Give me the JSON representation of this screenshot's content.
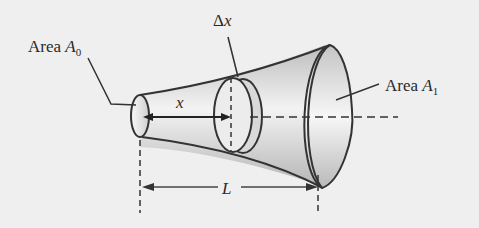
{
  "diagram": {
    "labels": {
      "area_small": {
        "prefix": "Area ",
        "var": "A",
        "sub": "0"
      },
      "area_large": {
        "prefix": "Area ",
        "var": "A",
        "sub": "1"
      },
      "delta_x": {
        "delta": "Δ",
        "var": "x"
      },
      "x": "x",
      "L": "L"
    },
    "colors": {
      "background": "#efefef",
      "stroke": "#333333",
      "shade_dark": "#b8b8b8",
      "shade_light": "#f4f4f4"
    }
  }
}
